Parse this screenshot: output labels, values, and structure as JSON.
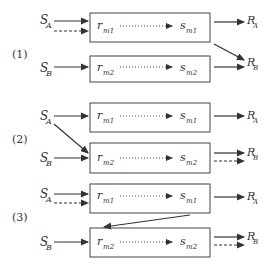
{
  "diagram": {
    "panels": [
      {
        "label": "(1)",
        "inputs": {
          "a": "S",
          "a_sub": "A",
          "b": "S",
          "b_sub": "B"
        },
        "box1": {
          "left": "r",
          "left_sub": "m1",
          "right": "s",
          "right_sub": "m1"
        },
        "box2": {
          "left": "r",
          "left_sub": "m2",
          "right": "s",
          "right_sub": "m2"
        },
        "outputs": {
          "a": "R",
          "a_sub": "A",
          "b": "R",
          "b_sub": "B"
        },
        "description": "S_A solid and dashed into box1; S_B into box2; box1 -> R_A and diagonal box1 -> R_B; box2 -> R_B"
      },
      {
        "label": "(2)",
        "inputs": {
          "a": "S",
          "a_sub": "A",
          "b": "S",
          "b_sub": "B"
        },
        "box1": {
          "left": "r",
          "left_sub": "m1",
          "right": "s",
          "right_sub": "m1"
        },
        "box2": {
          "left": "r",
          "left_sub": "m2",
          "right": "s",
          "right_sub": "m2"
        },
        "outputs": {
          "a": "R",
          "a_sub": "A",
          "b": "R",
          "b_sub": "B"
        },
        "description": "S_A into box1 and diagonal S_A -> box2; S_B into box2; box1 -> R_A; box2 solid and dashed -> R_B"
      },
      {
        "label": "(3)",
        "inputs": {
          "a": "S",
          "a_sub": "A",
          "b": "S",
          "b_sub": "B"
        },
        "box1": {
          "left": "r",
          "left_sub": "m1",
          "right": "s",
          "right_sub": "m1"
        },
        "box2": {
          "left": "r",
          "left_sub": "m2",
          "right": "s",
          "right_sub": "m2"
        },
        "outputs": {
          "a": "R",
          "a_sub": "A",
          "b": "R",
          "b_sub": "B"
        },
        "description": "S_A solid and dashed into box1; box1 -> box2 diagonal; S_B into box2; box1 -> R_A; box2 solid and dashed -> R_B"
      }
    ]
  }
}
